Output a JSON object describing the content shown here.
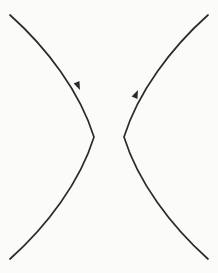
{
  "figure": {
    "title": "Hyperbola with two opposing branches",
    "type": "geometric-curve-diagram",
    "width": 218,
    "height": 273,
    "background_color": "#fbfbfa",
    "stroke_color": "#2b2b2b",
    "stroke_width": 1.7,
    "center": {
      "x": 109,
      "y": 137
    },
    "branches": [
      {
        "name": "left-branch",
        "opens": "left",
        "vertex": {
          "x": 94,
          "y": 137
        },
        "top_endpoint": {
          "x": 10,
          "y": 15
        },
        "bottom_endpoint": {
          "x": 10,
          "y": 259
        },
        "path": "M 10 15 C 47 48, 80 92, 94 137 C 80 182, 47 226, 10 259",
        "marker": {
          "name": "direction-arrow",
          "position": {
            "x": 80,
            "y": 90
          },
          "points": "down-right",
          "angle_deg": 66
        }
      },
      {
        "name": "right-branch",
        "opens": "right",
        "vertex": {
          "x": 124,
          "y": 137
        },
        "top_endpoint": {
          "x": 208,
          "y": 15
        },
        "bottom_endpoint": {
          "x": 208,
          "y": 259
        },
        "path": "M 208 15 C 171 48, 138 92, 124 137 C 138 182, 171 226, 208 259",
        "marker": {
          "name": "direction-arrow",
          "position": {
            "x": 138,
            "y": 90
          },
          "points": "up-right",
          "angle_deg": -66
        }
      }
    ],
    "labels": [],
    "axes_visible": false,
    "gridlines_visible": false
  }
}
